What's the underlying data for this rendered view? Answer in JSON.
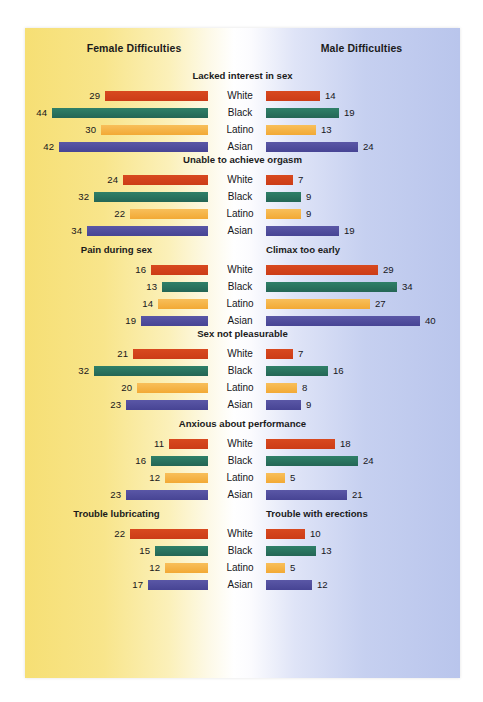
{
  "header": {
    "female_label": "Female Difficulties",
    "male_label": "Male Difficulties"
  },
  "colors": {
    "white": "#d4411e",
    "black": "#2c7a64",
    "latino": "#f5b041",
    "asian": "#4f4d9e",
    "bg_left": "#f6df74",
    "bg_right": "#b9c5ec"
  },
  "chart_data": {
    "type": "bar",
    "title": "",
    "xlabel": "",
    "ylabel": "",
    "categories": [
      "White",
      "Black",
      "Latino",
      "Asian"
    ],
    "orientation": "horizontal-diverging",
    "grid": false,
    "legend_position": "none",
    "panels": [
      {
        "title_mode": "center",
        "female_title": "Lacked interest in sex",
        "male_title": "Lacked interest in sex",
        "female_values": [
          29,
          44,
          30,
          42
        ],
        "male_values": [
          14,
          19,
          13,
          24
        ]
      },
      {
        "title_mode": "center",
        "female_title": "Unable to achieve orgasm",
        "male_title": "Unable to achieve orgasm",
        "female_values": [
          24,
          32,
          22,
          34
        ],
        "male_values": [
          7,
          9,
          9,
          19
        ]
      },
      {
        "title_mode": "split",
        "female_title": "Pain during sex",
        "male_title": "Climax too early",
        "female_values": [
          16,
          13,
          14,
          19
        ],
        "male_values": [
          29,
          34,
          27,
          40
        ]
      },
      {
        "title_mode": "center",
        "female_title": "Sex not pleasurable",
        "male_title": "Sex not pleasurable",
        "female_values": [
          21,
          32,
          20,
          23
        ],
        "male_values": [
          7,
          16,
          8,
          9
        ]
      },
      {
        "title_mode": "center",
        "female_title": "Anxious about performance",
        "male_title": "Anxious about performance",
        "female_values": [
          11,
          16,
          12,
          23
        ],
        "male_values": [
          18,
          24,
          5,
          21
        ]
      },
      {
        "title_mode": "split",
        "female_title": "Trouble lubricating",
        "male_title": "Trouble with erections",
        "female_values": [
          22,
          15,
          12,
          17
        ],
        "male_values": [
          10,
          13,
          5,
          12
        ]
      }
    ]
  }
}
